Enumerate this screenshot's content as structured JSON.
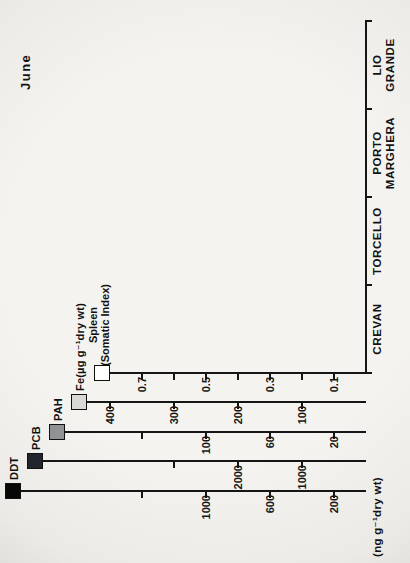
{
  "figure": {
    "title": "June",
    "y_units_label": "(ng g⁻¹dry wt)",
    "orientation": "landscape chart rotated 90deg CCW in scan",
    "axis_color": "#151515",
    "background": "#f2f1ee"
  },
  "chart_data": {
    "type": "bar",
    "title": "June",
    "categories": [
      "CREVAN",
      "TORCELLO",
      "PORTO MARGHERA",
      "LIO GRANDE"
    ],
    "bar_order_note": "within each site group, left to right: Spleen, Fe, PAH, PCB, DDT",
    "legend_order": [
      "DDT",
      "PCB",
      "PAH",
      "Fe(µg g⁻¹dry wt)",
      "Spleen (Somatic Index)"
    ],
    "y_units_label": "(ng g⁻¹dry wt)",
    "grid": false,
    "series": [
      {
        "name": "Spleen",
        "legend_label": "Spleen",
        "legend_sublabel": "(Somatic Index)",
        "color": "#ffffff",
        "values": [
          0.33,
          0.54,
          0.23,
          0.64
        ],
        "errors": [
          0.07,
          0.11,
          0.02,
          0.14
        ],
        "axis_unit": "Somatic Index",
        "ticks": [
          {
            "v": 0.1,
            "label": "0.1"
          },
          {
            "v": 0.2
          },
          {
            "v": 0.3,
            "label": "0.3"
          },
          {
            "v": 0.4
          },
          {
            "v": 0.5,
            "label": "0.5"
          },
          {
            "v": 0.6
          },
          {
            "v": 0.7,
            "label": "0.7"
          }
        ]
      },
      {
        "name": "Fe",
        "legend_label": "Fe(µg g⁻¹dry wt)",
        "color": "#d8d9d4",
        "values": [
          290,
          140,
          70,
          135
        ],
        "axis_unit": "µg g⁻¹ dry wt",
        "ticks": [
          {
            "v": 100,
            "label": "100"
          },
          {
            "v": 200,
            "label": "200"
          },
          {
            "v": 300,
            "label": "300"
          },
          {
            "v": 400,
            "label": "400"
          }
        ]
      },
      {
        "name": "PAH",
        "legend_label": "PAH",
        "color": "#909296",
        "values": [
          65,
          87,
          56,
          88
        ],
        "axis_unit": "ng g⁻¹ dry wt",
        "ticks": [
          {
            "v": 20,
            "label": "20"
          },
          {
            "v": 60,
            "label": "60"
          },
          {
            "v": 100,
            "label": "100"
          },
          {
            "v": 140
          }
        ]
      },
      {
        "name": "PCB",
        "legend_label": "PCB",
        "color": "#22252b",
        "values": [
          2310,
          1730,
          1890,
          1270
        ],
        "axis_unit": "ng g⁻¹ dry wt",
        "ticks": [
          {
            "v": 1000,
            "label": "1000"
          },
          {
            "v": 2000,
            "label": "2000"
          },
          {
            "v": 3000
          }
        ]
      },
      {
        "name": "DDT",
        "legend_label": "DDT",
        "color": "#070707",
        "values": [
          220,
          195,
          830,
          175
        ],
        "axis_unit": "ng g⁻¹ dry wt",
        "ticks": [
          {
            "v": 200,
            "label": "200"
          },
          {
            "v": 600,
            "label": "600"
          },
          {
            "v": 1000,
            "label": "1000"
          },
          {
            "v": 1400
          }
        ]
      }
    ]
  }
}
